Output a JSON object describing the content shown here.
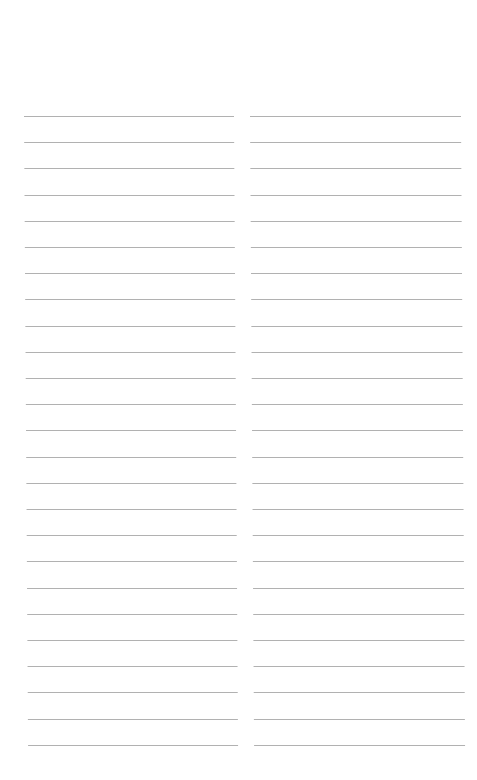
{
  "page": {
    "type": "lined-notepad",
    "background": "#ffffff",
    "line_color": "#a9a9a9",
    "columns": [
      {
        "name": "left",
        "line_count": 25,
        "lines": [
          "",
          "",
          "",
          "",
          "",
          "",
          "",
          "",
          "",
          "",
          "",
          "",
          "",
          "",
          "",
          "",
          "",
          "",
          "",
          "",
          "",
          "",
          "",
          "",
          ""
        ]
      },
      {
        "name": "right",
        "line_count": 25,
        "lines": [
          "",
          "",
          "",
          "",
          "",
          "",
          "",
          "",
          "",
          "",
          "",
          "",
          "",
          "",
          "",
          "",
          "",
          "",
          "",
          "",
          "",
          "",
          "",
          "",
          ""
        ]
      }
    ],
    "line_spacing_px": 26.2
  }
}
